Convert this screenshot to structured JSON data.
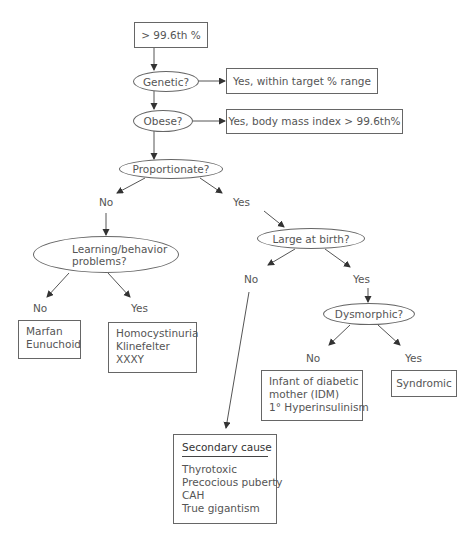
{
  "nodes": {
    "start": {
      "text": "> 99.6th %"
    },
    "genetic": {
      "text": "Genetic?"
    },
    "genetic_yes": {
      "text": "Yes, within target % range"
    },
    "obese": {
      "text": "Obese?"
    },
    "obese_yes": {
      "text": "Yes, body mass index > 99.6th%"
    },
    "proportionate": {
      "text": "Proportionate?"
    },
    "learning": {
      "lines": [
        "Learning/behavior",
        "problems?"
      ]
    },
    "learning_no": {
      "lines": [
        "Marfan",
        "Eunuchoid"
      ]
    },
    "learning_yes": {
      "lines": [
        "Homocystinuria",
        "Klinefelter",
        "XXXY"
      ]
    },
    "large_birth": {
      "text": "Large at birth?"
    },
    "dysmorphic": {
      "text": "Dysmorphic?"
    },
    "dysmorphic_no": {
      "lines": [
        "Infant of diabetic",
        "mother (IDM)",
        "1° Hyperinsulinism"
      ]
    },
    "dysmorphic_yes": {
      "text": "Syndromic"
    },
    "secondary": {
      "title": "Secondary cause",
      "lines": [
        "Thyrotoxic",
        "Precocious puberty",
        "CAH",
        "True gigantism"
      ]
    }
  },
  "labels": {
    "prop_no": "No",
    "prop_yes": "Yes",
    "learn_no": "No",
    "learn_yes": "Yes",
    "large_no": "No",
    "large_yes": "Yes",
    "dys_no": "No",
    "dys_yes": "Yes"
  },
  "colors": {
    "line": "#444444",
    "text": "#555555",
    "border": "#666666"
  }
}
